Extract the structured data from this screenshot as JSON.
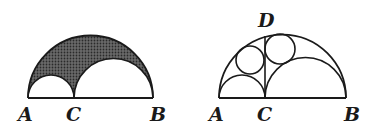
{
  "figures": [
    {
      "id": "left",
      "description": "Semicircle on AB with two inner semicircles on AC and CB; region between them shaded",
      "labels": {
        "A": "A",
        "C": "C",
        "B": "B"
      },
      "shaded_region": "between big semicircle and two small semicircles"
    },
    {
      "id": "right",
      "description": "Semicircle on AB with inner semicircles on AC and CB, perpendicular CD, and two inscribed circles",
      "labels": {
        "A": "A",
        "C": "C",
        "B": "B",
        "D": "D"
      }
    }
  ],
  "colors": {
    "stroke": "#1a1a1a",
    "shade": "#3a3a3a",
    "background": "#ffffff"
  }
}
